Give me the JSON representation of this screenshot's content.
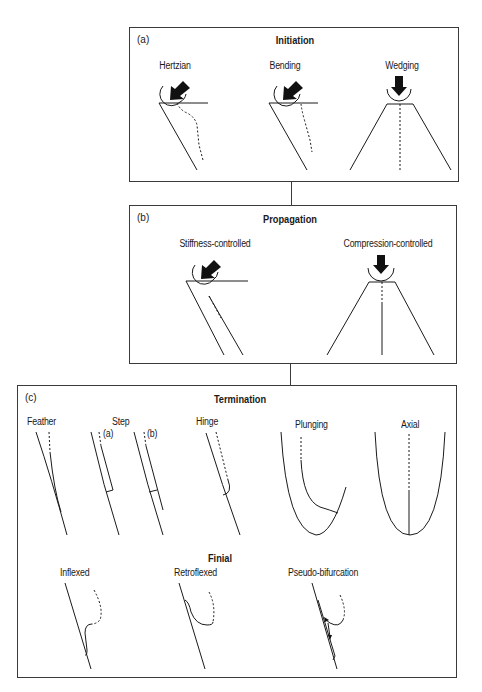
{
  "panels": {
    "initiation": {
      "tag": "(a)",
      "title": "Initiation",
      "items": [
        {
          "label": "Hertzian"
        },
        {
          "label": "Bending"
        },
        {
          "label": "Wedging"
        }
      ]
    },
    "propagation": {
      "tag": "(b)",
      "title": "Propagation",
      "items": [
        {
          "label": "Stiffness-controlled"
        },
        {
          "label": "Compression-controlled"
        }
      ]
    },
    "termination": {
      "tag": "(c)",
      "title": "Termination",
      "items": [
        {
          "label": "Feather"
        },
        {
          "label": "Step"
        },
        {
          "label": "Hinge"
        },
        {
          "label": "Plunging"
        },
        {
          "label": "Axial"
        }
      ],
      "step_variants": [
        "(a)",
        "(b)"
      ],
      "finial": {
        "title": "Finial",
        "items": [
          {
            "label": "Inflexed"
          },
          {
            "label": "Retroflexed"
          },
          {
            "label": "Pseudo-bifurcation"
          }
        ]
      }
    }
  },
  "colors": {
    "line": "#1a1a1a",
    "border": "#3a3a3a",
    "background": "#ffffff"
  }
}
